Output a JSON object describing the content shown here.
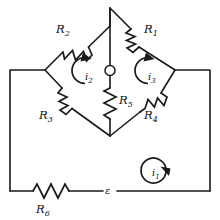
{
  "figure": {
    "type": "circuit-diagram",
    "background_color": "#ffffff",
    "line_color": "#1a1a1a"
  },
  "components": {
    "resistors": [
      {
        "id": "R1",
        "label": "R",
        "subscript": "1",
        "position": "upper-right-arm"
      },
      {
        "id": "R2",
        "label": "R",
        "subscript": "2",
        "position": "upper-left-arm"
      },
      {
        "id": "R3",
        "label": "R",
        "subscript": "3",
        "position": "lower-left-arm"
      },
      {
        "id": "R4",
        "label": "R",
        "subscript": "4",
        "position": "lower-right-arm"
      },
      {
        "id": "R5",
        "label": "R",
        "subscript": "5",
        "position": "bridge-center-vertical"
      },
      {
        "id": "R6",
        "label": "R",
        "subscript": "6",
        "position": "bottom-wire-left"
      }
    ],
    "source": {
      "id": "emf",
      "label": "ε",
      "position": "bottom-wire-center"
    },
    "node": {
      "id": "center-node",
      "shape": "circle",
      "position": "bridge-midpoint"
    }
  },
  "mesh_currents": [
    {
      "id": "i1",
      "label": "i",
      "subscript": "1",
      "direction": "clockwise",
      "position": "outer-loop-lower-right"
    },
    {
      "id": "i2",
      "label": "i",
      "subscript": "2",
      "direction": "clockwise",
      "position": "left-bridge-mesh"
    },
    {
      "id": "i3",
      "label": "i",
      "subscript": "3",
      "direction": "clockwise",
      "position": "right-bridge-mesh"
    }
  ]
}
